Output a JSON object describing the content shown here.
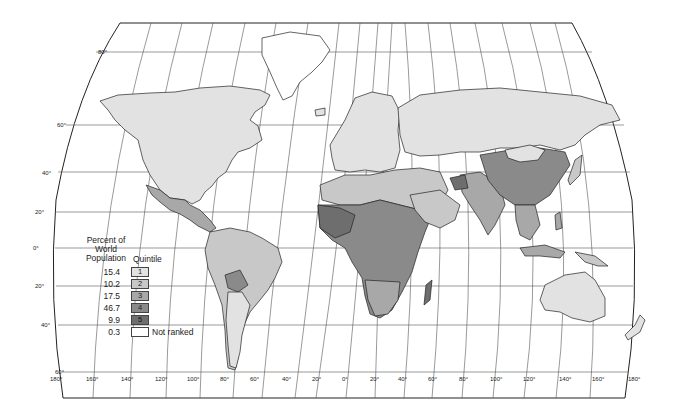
{
  "map": {
    "title": "",
    "projection": "Robinson-like world projection",
    "latitude_labels": [
      "80°",
      "60°",
      "40°",
      "20°",
      "0°",
      "20°",
      "40°",
      "60°"
    ],
    "longitude_labels": [
      "180°",
      "160°",
      "140°",
      "120°",
      "100°",
      "80°",
      "60°",
      "40°",
      "20°",
      "0°",
      "20°",
      "40°",
      "60°",
      "80°",
      "100°",
      "120°",
      "140°",
      "160°",
      "180°"
    ]
  },
  "legend": {
    "header_left": "Percent of World Population",
    "header_left_lines": [
      "Percent of",
      "World",
      "Population"
    ],
    "header_right": "Quintile",
    "items": [
      {
        "percent": "15.4",
        "quintile": "1",
        "color": "#e2e2e2"
      },
      {
        "percent": "10.2",
        "quintile": "2",
        "color": "#c8c8c8"
      },
      {
        "percent": "17.5",
        "quintile": "3",
        "color": "#a8a8a8"
      },
      {
        "percent": "46.7",
        "quintile": "4",
        "color": "#8a8a8a"
      },
      {
        "percent": "9.9",
        "quintile": "5",
        "color": "#6e6e6e"
      },
      {
        "percent": "0.3",
        "quintile": "Not ranked",
        "color": "#ffffff"
      }
    ]
  },
  "colors": {
    "q1": "#e2e2e2",
    "q2": "#c8c8c8",
    "q3": "#a8a8a8",
    "q4": "#8a8a8a",
    "q5": "#6e6e6e",
    "not_ranked": "#ffffff",
    "outline": "#222222",
    "grid": "#555555"
  }
}
